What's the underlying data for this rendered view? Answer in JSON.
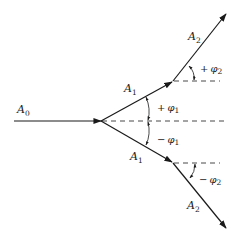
{
  "diagram": {
    "type": "vector branching diagram",
    "colors": {
      "stroke": "#1a1a1a",
      "background": "#ffffff"
    },
    "labels": {
      "a0": {
        "main": "A",
        "sub": "0"
      },
      "a1_upper": {
        "main": "A",
        "sub": "1"
      },
      "a1_lower": {
        "main": "A",
        "sub": "1"
      },
      "a2_upper": {
        "main": "A",
        "sub": "2"
      },
      "a2_lower": {
        "main": "A",
        "sub": "2"
      },
      "phi1_plus": {
        "sign": "+",
        "main": "φ",
        "sub": "1"
      },
      "phi1_minus": {
        "sign": "−",
        "main": "φ",
        "sub": "1"
      },
      "phi2_plus": {
        "sign": "+",
        "main": "φ",
        "sub": "2"
      },
      "phi2_minus": {
        "sign": "−",
        "main": "φ",
        "sub": "2"
      }
    }
  }
}
